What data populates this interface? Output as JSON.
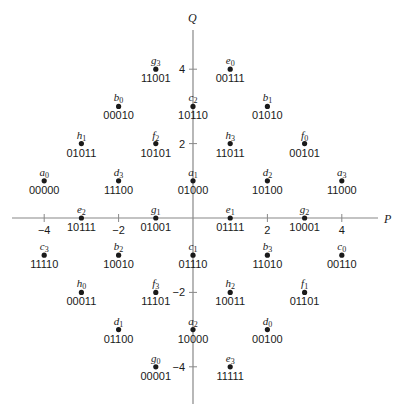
{
  "diagram": {
    "type": "constellation",
    "axes": {
      "x_label": "P",
      "y_label": "Q",
      "x_ticks": [
        -4,
        -2,
        2,
        4
      ],
      "y_ticks": [
        4,
        2,
        -2,
        -4
      ],
      "range": [
        -5,
        5
      ]
    },
    "points": [
      {
        "sym": "g",
        "sub": "3",
        "bits": "11001",
        "p": -1,
        "q": 4
      },
      {
        "sym": "e",
        "sub": "0",
        "bits": "00111",
        "p": 1,
        "q": 4
      },
      {
        "sym": "b",
        "sub": "0",
        "bits": "00010",
        "p": -2,
        "q": 3
      },
      {
        "sym": "c",
        "sub": "2",
        "bits": "10110",
        "p": 0,
        "q": 3
      },
      {
        "sym": "b",
        "sub": "1",
        "bits": "01010",
        "p": 2,
        "q": 3
      },
      {
        "sym": "h",
        "sub": "1",
        "bits": "01011",
        "p": -3,
        "q": 2
      },
      {
        "sym": "f",
        "sub": "2",
        "bits": "10101",
        "p": -1,
        "q": 2
      },
      {
        "sym": "h",
        "sub": "3",
        "bits": "11011",
        "p": 1,
        "q": 2
      },
      {
        "sym": "f",
        "sub": "0",
        "bits": "00101",
        "p": 3,
        "q": 2
      },
      {
        "sym": "a",
        "sub": "0",
        "bits": "00000",
        "p": -4,
        "q": 1
      },
      {
        "sym": "d",
        "sub": "3",
        "bits": "11100",
        "p": -2,
        "q": 1
      },
      {
        "sym": "a",
        "sub": "1",
        "bits": "01000",
        "p": 0,
        "q": 1
      },
      {
        "sym": "d",
        "sub": "2",
        "bits": "10100",
        "p": 2,
        "q": 1
      },
      {
        "sym": "a",
        "sub": "3",
        "bits": "11000",
        "p": 4,
        "q": 1
      },
      {
        "sym": "e",
        "sub": "2",
        "bits": "10111",
        "p": -3,
        "q": 0
      },
      {
        "sym": "g",
        "sub": "1",
        "bits": "01001",
        "p": -1,
        "q": 0
      },
      {
        "sym": "e",
        "sub": "1",
        "bits": "01111",
        "p": 1,
        "q": 0
      },
      {
        "sym": "g",
        "sub": "2",
        "bits": "10001",
        "p": 3,
        "q": 0
      },
      {
        "sym": "c",
        "sub": "3",
        "bits": "11110",
        "p": -4,
        "q": -1
      },
      {
        "sym": "b",
        "sub": "2",
        "bits": "10010",
        "p": -2,
        "q": -1
      },
      {
        "sym": "c",
        "sub": "1",
        "bits": "01110",
        "p": 0,
        "q": -1
      },
      {
        "sym": "b",
        "sub": "3",
        "bits": "11010",
        "p": 2,
        "q": -1
      },
      {
        "sym": "c",
        "sub": "0",
        "bits": "00110",
        "p": 4,
        "q": -1
      },
      {
        "sym": "h",
        "sub": "0",
        "bits": "00011",
        "p": -3,
        "q": -2
      },
      {
        "sym": "f",
        "sub": "3",
        "bits": "11101",
        "p": -1,
        "q": -2
      },
      {
        "sym": "h",
        "sub": "2",
        "bits": "10011",
        "p": 1,
        "q": -2
      },
      {
        "sym": "f",
        "sub": "1",
        "bits": "01101",
        "p": 3,
        "q": -2
      },
      {
        "sym": "d",
        "sub": "1",
        "bits": "01100",
        "p": -2,
        "q": -3
      },
      {
        "sym": "a",
        "sub": "2",
        "bits": "10000",
        "p": 0,
        "q": -3
      },
      {
        "sym": "d",
        "sub": "0",
        "bits": "00100",
        "p": 2,
        "q": -3
      },
      {
        "sym": "g",
        "sub": "0",
        "bits": "00001",
        "p": -1,
        "q": -4
      },
      {
        "sym": "e",
        "sub": "3",
        "bits": "11111",
        "p": 1,
        "q": -4
      }
    ],
    "colors": {
      "ink": "#1a1a1a",
      "axis": "#888888"
    }
  }
}
